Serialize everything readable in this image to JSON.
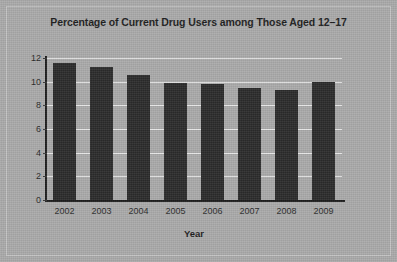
{
  "chart_data": {
    "type": "bar",
    "title": "Percentage of Current Drug Users among Those Aged 12–17",
    "xlabel": "Year",
    "ylabel": "",
    "categories": [
      "2002",
      "2003",
      "2004",
      "2005",
      "2006",
      "2007",
      "2008",
      "2009"
    ],
    "values": [
      11.6,
      11.2,
      10.6,
      9.9,
      9.8,
      9.5,
      9.3,
      10.0
    ],
    "ylim": [
      0,
      12
    ],
    "yticks": [
      0,
      2,
      4,
      6,
      8,
      10,
      12
    ],
    "ytick_labels": [
      "0",
      "2",
      "4",
      "6",
      "8",
      "10",
      "12"
    ],
    "grid": true,
    "legend": false,
    "bar_color": "#2b2b2b",
    "background_color": "#a9a9a9",
    "gridline_color": "#e6e6e6",
    "axis_color": "#1d1d1d"
  }
}
